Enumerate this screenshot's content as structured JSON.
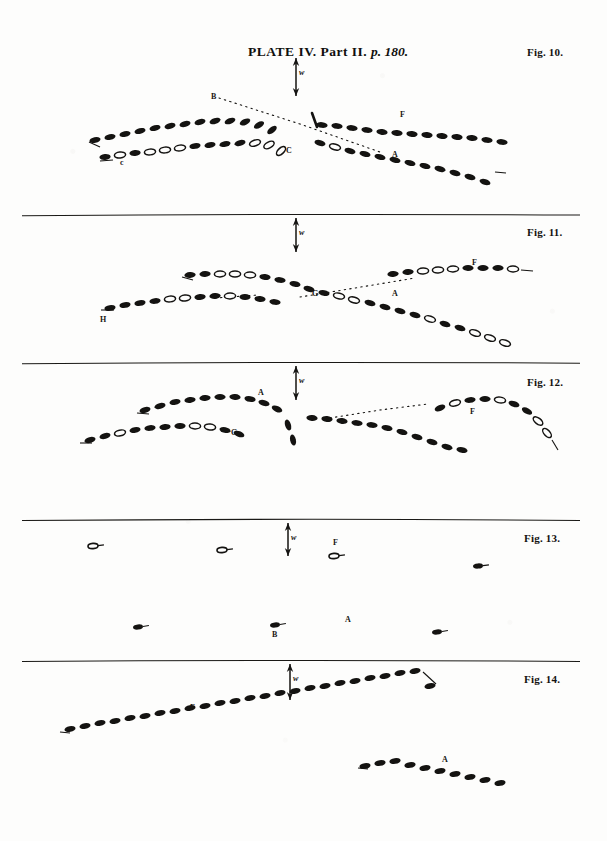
{
  "plate": {
    "title_plate": "PLATE",
    "title_number": "IV.",
    "title_part": "Part II.",
    "title_page": "p. 180.",
    "title_full": "PLATE IV. Part II. p. 180.",
    "paper_color": "#fdfdfc",
    "ink_color": "#141311"
  },
  "figures": [
    {
      "id": "fig10",
      "label": "Fig. 10.",
      "wind_marker": "w",
      "point_labels": [
        {
          "text": "B",
          "x": 211,
          "y": 97
        },
        {
          "text": "c",
          "x": 120,
          "y": 163
        },
        {
          "text": "C",
          "x": 286,
          "y": 151
        },
        {
          "text": "F",
          "x": 400,
          "y": 115
        },
        {
          "text": "A",
          "x": 392,
          "y": 155
        }
      ]
    },
    {
      "id": "fig11",
      "label": "Fig. 11.",
      "wind_marker": "w",
      "point_labels": [
        {
          "text": "H",
          "x": 100,
          "y": 320
        },
        {
          "text": "G",
          "x": 312,
          "y": 294
        },
        {
          "text": "A",
          "x": 392,
          "y": 294
        },
        {
          "text": "F",
          "x": 472,
          "y": 263
        }
      ]
    },
    {
      "id": "fig12",
      "label": "Fig. 12.",
      "wind_marker": "w",
      "point_labels": [
        {
          "text": "A",
          "x": 258,
          "y": 393
        },
        {
          "text": "G",
          "x": 231,
          "y": 433
        },
        {
          "text": "F",
          "x": 470,
          "y": 412
        }
      ]
    },
    {
      "id": "fig13",
      "label": "Fig. 13.",
      "wind_marker": "w",
      "point_labels": [
        {
          "text": "F",
          "x": 333,
          "y": 543
        },
        {
          "text": "A",
          "x": 345,
          "y": 620
        },
        {
          "text": "B",
          "x": 272,
          "y": 635
        }
      ]
    },
    {
      "id": "fig14",
      "label": "Fig. 14.",
      "wind_marker": "w",
      "point_labels": [
        {
          "text": "F",
          "x": 190,
          "y": 708
        },
        {
          "text": "A",
          "x": 442,
          "y": 760
        }
      ]
    }
  ],
  "rules": [
    {
      "y": 215,
      "x1": 22,
      "x2": 580
    },
    {
      "y": 363,
      "x1": 22,
      "x2": 580
    },
    {
      "y": 520,
      "x1": 22,
      "x2": 580
    },
    {
      "y": 661,
      "x1": 22,
      "x2": 580
    }
  ]
}
